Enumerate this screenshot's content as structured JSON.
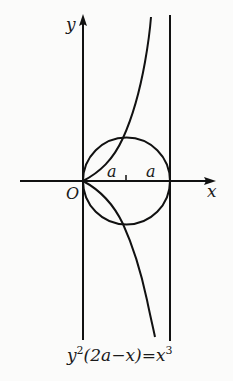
{
  "diagram": {
    "type": "cissoid of Diocles",
    "axes": {
      "x_label": "x",
      "y_label": "y",
      "origin_label": "O"
    },
    "circle": {
      "label_left": "a",
      "label_right": "a",
      "radius_label": "a"
    },
    "asymptote": {
      "position": "x = 2a"
    },
    "equation": {
      "lhs_base": "y",
      "lhs_exp": "2",
      "lhs_paren": "(2a−x)",
      "equals": "=",
      "rhs_base": "x",
      "rhs_exp": "3"
    },
    "colors": {
      "stroke": "#111111",
      "background": "#fbfbfa"
    }
  }
}
